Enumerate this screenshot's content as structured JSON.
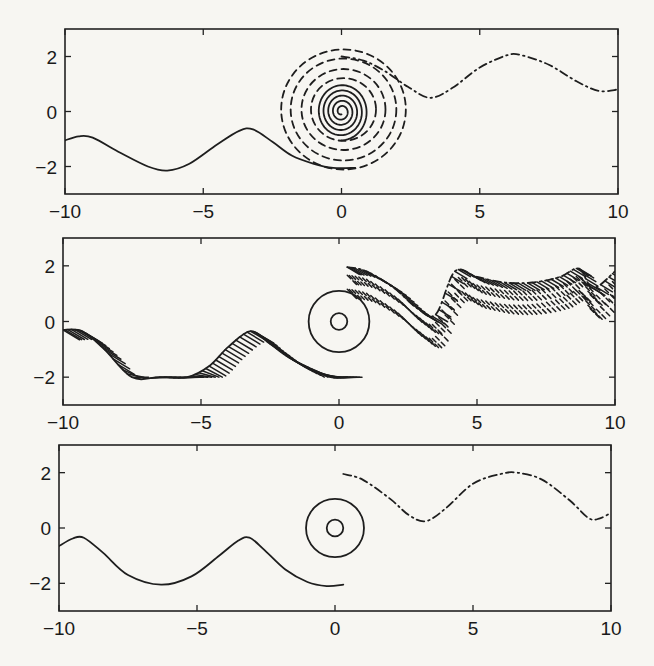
{
  "chart_data": [
    {
      "type": "line",
      "panel": "top",
      "title": "",
      "xlabel": "",
      "ylabel": "",
      "xlim": [
        -10,
        10
      ],
      "ylim": [
        -3,
        3
      ],
      "xticks": [
        -10,
        -5,
        0,
        5,
        10
      ],
      "yticks": [
        -2,
        0,
        2
      ],
      "xtick_labels": [
        "−10",
        "−5",
        "0",
        "5",
        "10"
      ],
      "ytick_labels": [
        "−2",
        "0",
        "2"
      ],
      "grid": false,
      "series": [
        {
          "name": "left-wave-solid",
          "style": "solid",
          "x": [
            -10,
            -9.5,
            -9,
            -8,
            -7,
            -6.3,
            -5.5,
            -4.5,
            -3.7,
            -3.2,
            -2.5,
            -1.8,
            -1,
            -0.3,
            0.5
          ],
          "y": [
            -1.05,
            -0.9,
            -0.95,
            -1.5,
            -2.0,
            -2.15,
            -1.9,
            -1.2,
            -0.7,
            -0.65,
            -1.1,
            -1.6,
            -1.9,
            -2.05,
            -2.05
          ]
        },
        {
          "name": "inner-spiral-solid",
          "style": "solid",
          "shape": "spiral",
          "center": [
            0,
            0
          ],
          "r_outer": 1.0,
          "r_inner": 0.1,
          "turns": 5
        },
        {
          "name": "middle-dashed-rings",
          "style": "dashed",
          "shape": "rings",
          "center": [
            0,
            0
          ],
          "radii": [
            1.2,
            1.55,
            1.95,
            2.3
          ]
        },
        {
          "name": "right-wave-dashdot",
          "style": "dashdot",
          "x": [
            0,
            0.8,
            1.6,
            2.4,
            3.2,
            4,
            5,
            6,
            6.5,
            7.5,
            8.5,
            9.3,
            10
          ],
          "y": [
            2.0,
            1.85,
            1.45,
            0.9,
            0.5,
            0.85,
            1.6,
            2.05,
            2.05,
            1.7,
            1.1,
            0.75,
            0.8
          ]
        }
      ]
    },
    {
      "type": "line",
      "panel": "middle",
      "title": "",
      "xlabel": "",
      "ylabel": "",
      "xlim": [
        -10,
        10
      ],
      "ylim": [
        -3,
        3
      ],
      "xticks": [
        -10,
        -5,
        0,
        5,
        10
      ],
      "yticks": [
        -2,
        0,
        2
      ],
      "xtick_labels": [
        "−10",
        "−5",
        "0",
        "5",
        "10"
      ],
      "ytick_labels": [
        "−2",
        "0",
        "2"
      ],
      "grid": false,
      "series": [
        {
          "name": "left-zigzag-solid",
          "style": "hatched-solid",
          "x": [
            -10,
            -9.3,
            -8.5,
            -7.5,
            -6.5,
            -5.5,
            -4.7,
            -4,
            -3.2,
            -2.5,
            -1.8,
            -1,
            -0.3,
            0.3
          ],
          "y": [
            -0.3,
            -0.35,
            -1.0,
            -2.0,
            -2.0,
            -2.0,
            -1.6,
            -0.9,
            -0.35,
            -0.8,
            -1.3,
            -1.7,
            -2.0,
            -2.0
          ]
        },
        {
          "name": "outer-circle",
          "style": "solid",
          "shape": "circle",
          "center": [
            0,
            0
          ],
          "r": 1.1
        },
        {
          "name": "inner-circle",
          "style": "solid",
          "shape": "circle",
          "center": [
            0,
            0
          ],
          "r": 0.3
        },
        {
          "name": "right-hatched-dashdot",
          "style": "hatched-dashdot",
          "x": [
            0.3,
            1,
            2,
            2.8,
            3.5,
            4.2,
            5,
            6,
            7,
            8,
            8.7,
            9.2,
            10
          ],
          "y": [
            1.95,
            1.8,
            1.2,
            0.5,
            0.25,
            1.8,
            1.6,
            1.4,
            1.4,
            1.6,
            1.9,
            1.2,
            1.8
          ]
        }
      ]
    },
    {
      "type": "line",
      "panel": "bottom",
      "title": "",
      "xlabel": "",
      "ylabel": "",
      "xlim": [
        -10,
        10
      ],
      "ylim": [
        -3,
        3
      ],
      "xticks": [
        -10,
        -5,
        0,
        5,
        10
      ],
      "yticks": [
        -2,
        0,
        2
      ],
      "xtick_labels": [
        "−10",
        "−5",
        "0",
        "5",
        "10"
      ],
      "ytick_labels": [
        "−2",
        "0",
        "2"
      ],
      "grid": false,
      "series": [
        {
          "name": "left-wave-solid",
          "style": "solid",
          "x": [
            -10,
            -9.5,
            -9.1,
            -8.4,
            -7.5,
            -6.3,
            -5.2,
            -4.2,
            -3.5,
            -3.1,
            -2.6,
            -1.8,
            -1,
            -0.3,
            0.3
          ],
          "y": [
            -0.65,
            -0.38,
            -0.35,
            -0.9,
            -1.7,
            -2.05,
            -1.75,
            -1.0,
            -0.45,
            -0.35,
            -0.75,
            -1.5,
            -1.95,
            -2.1,
            -2.05
          ]
        },
        {
          "name": "outer-circle",
          "style": "solid",
          "shape": "circle",
          "center": [
            0,
            0
          ],
          "r": 1.05
        },
        {
          "name": "inner-circle",
          "style": "solid",
          "shape": "circle",
          "center": [
            0,
            0
          ],
          "r": 0.3
        },
        {
          "name": "right-wave-dashdot",
          "style": "dashdot",
          "x": [
            0.3,
            1,
            2,
            2.7,
            3.3,
            4,
            5,
            6,
            6.6,
            7.5,
            8.5,
            9.2,
            9.6,
            10
          ],
          "y": [
            1.95,
            1.75,
            1.05,
            0.45,
            0.25,
            0.7,
            1.6,
            1.95,
            2.0,
            1.75,
            1.0,
            0.35,
            0.35,
            0.55
          ]
        }
      ]
    }
  ],
  "panels": [
    {
      "box": [
        65,
        29,
        618,
        194
      ]
    },
    {
      "box": [
        63,
        238,
        615,
        405
      ]
    },
    {
      "box": [
        59,
        445,
        611,
        611
      ]
    }
  ]
}
